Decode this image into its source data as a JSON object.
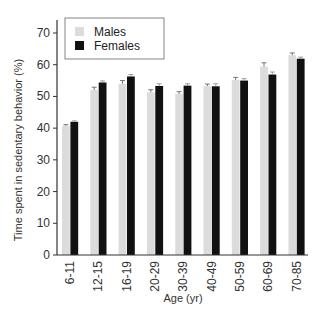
{
  "chart_data": {
    "type": "bar",
    "title": "",
    "xlabel": "Age (yr)",
    "ylabel": "Time spent in sedentary behavior (%)",
    "ylim": [
      0,
      70
    ],
    "yticks": [
      0,
      10,
      20,
      30,
      40,
      50,
      60,
      70
    ],
    "grid": false,
    "legend_position": "upper left",
    "categories": [
      "6-11",
      "12-15",
      "16-19",
      "20-29",
      "30-39",
      "40-49",
      "50-59",
      "60-69",
      "70-85"
    ],
    "series": [
      {
        "name": "Males",
        "color": "#dcdcdc",
        "values": [
          40.7,
          52.0,
          54.0,
          51.3,
          50.8,
          53.3,
          55.2,
          59.4,
          63.0
        ],
        "error": [
          0.4,
          0.9,
          1.0,
          0.8,
          0.7,
          0.6,
          0.8,
          1.2,
          0.7
        ]
      },
      {
        "name": "Females",
        "color": "#111111",
        "values": [
          42.0,
          54.4,
          56.3,
          53.3,
          53.4,
          53.2,
          55.0,
          56.9,
          61.9
        ],
        "error": [
          0.3,
          0.5,
          0.6,
          0.7,
          0.6,
          0.8,
          0.6,
          0.8,
          0.5
        ]
      }
    ]
  }
}
